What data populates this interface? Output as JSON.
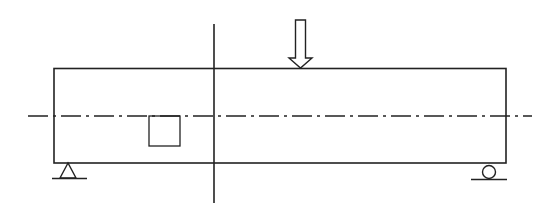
{
  "diagram": {
    "title": "",
    "type": "simply supported beam with point load",
    "stroke_color": "#222222",
    "background": "#ffffff",
    "elements": {
      "beam": {
        "x": 54,
        "y": 68,
        "width": 452,
        "height": 95
      },
      "center_line_vertical": {
        "x": 214,
        "y1": 24,
        "y2": 203
      },
      "neutral_axis_dashdot": {
        "y": 116,
        "x1": 28,
        "x2": 532
      },
      "load_arrow": {
        "x": 300,
        "y_top": 20,
        "y_tip": 68
      },
      "section_square": {
        "x": 149,
        "y": 116,
        "width": 31,
        "height": 30
      },
      "pin_support": {
        "x": 68,
        "y": 163
      },
      "roller_support": {
        "x": 489,
        "y": 163
      }
    }
  }
}
